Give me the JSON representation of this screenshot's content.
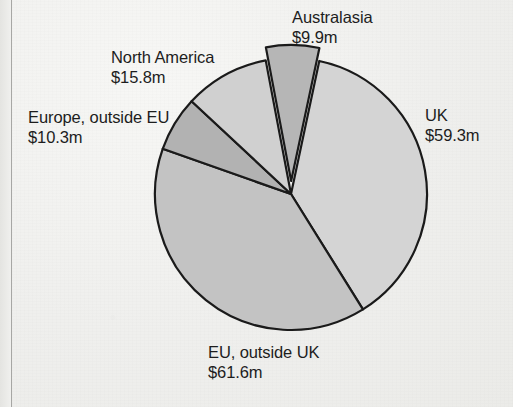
{
  "page": {
    "background_color": "#efefed",
    "margin_rule_color": "#9a9a98"
  },
  "chart_data": {
    "type": "pie",
    "title": "",
    "unit": "$m",
    "currency_symbol": "$",
    "total": 156.9,
    "categories": [
      "UK",
      "EU, outside UK",
      "Europe, outside EU",
      "North America",
      "Australasia"
    ],
    "values": [
      59.3,
      61.6,
      10.3,
      15.8,
      9.9
    ],
    "labels": [
      {
        "name": "UK",
        "value": "$59.3m",
        "number": 59.3,
        "color": "#d4d4d4",
        "position": "right",
        "exploded": false
      },
      {
        "name": "EU, outside UK",
        "value": "$61.6m",
        "number": 61.6,
        "color": "#c3c3c3",
        "position": "bottom",
        "exploded": false
      },
      {
        "name": "Europe, outside EU",
        "value": "$10.3m",
        "number": 10.3,
        "color": "#b2b2b2",
        "position": "left",
        "exploded": false
      },
      {
        "name": "North America",
        "value": "$15.8m",
        "number": 15.8,
        "color": "#d0d0d0",
        "position": "top-left",
        "exploded": false
      },
      {
        "name": "Australasia",
        "value": "$9.9m",
        "number": 9.9,
        "color": "#b6b6b6",
        "position": "top",
        "exploded": true
      }
    ],
    "legend": "none",
    "grid": false,
    "slice_outline_color": "#1a1a1a",
    "start_angle_deg": 12
  },
  "labels": {
    "uk": {
      "name": "UK",
      "value": "$59.3m"
    },
    "eu_outside_uk": {
      "name": "EU, outside UK",
      "value": "$61.6m"
    },
    "europe_outside_eu": {
      "name": "Europe, outside EU",
      "value": "$10.3m"
    },
    "north_america": {
      "name": "North America",
      "value": "$15.8m"
    },
    "australasia": {
      "name": "Australasia",
      "value": "$9.9m"
    }
  }
}
